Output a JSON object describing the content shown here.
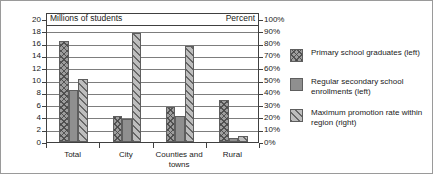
{
  "chart_data": {
    "type": "bar",
    "title": "",
    "subtitle": "",
    "left_axis_label": "Millions of students",
    "right_axis_label": "Percent",
    "xlabel": "",
    "ylabel": "Millions of students",
    "ylim": [
      0,
      20
    ],
    "y2lim": [
      0,
      100
    ],
    "y_ticks": [
      "0",
      "2",
      "4",
      "6",
      "8",
      "10",
      "12",
      "14",
      "16",
      "18",
      "20"
    ],
    "y2_ticks": [
      "0%",
      "10%",
      "20%",
      "30%",
      "40%",
      "50%",
      "60%",
      "70%",
      "80%",
      "90%",
      "100%"
    ],
    "grid": true,
    "legend_position": "right",
    "categories": [
      "Total",
      "City",
      "Counties and towns",
      "Rural"
    ],
    "series": [
      {
        "name": "Primary school graduates (left)",
        "axis": "left",
        "pattern": "crosshatch",
        "color": "#9d9d9d",
        "values": [
          16.5,
          4.3,
          5.7,
          6.8
        ]
      },
      {
        "name": "Regular secondary school enrollments (left)",
        "axis": "left",
        "pattern": "solid",
        "color": "#8f8f8f",
        "values": [
          8.5,
          3.8,
          4.3,
          0.6
        ]
      },
      {
        "name": "Maximum promotion rate within region (right)",
        "axis": "right",
        "pattern": "diagonal",
        "color": "#bdbdbd",
        "values": [
          51,
          89,
          78,
          5
        ]
      }
    ]
  },
  "legend": {
    "items": [
      {
        "label": "Primary school graduates (left)"
      },
      {
        "label": "Regular secondary school enrollments (left)"
      },
      {
        "label": "Maximum promotion rate within region (right)"
      }
    ]
  }
}
